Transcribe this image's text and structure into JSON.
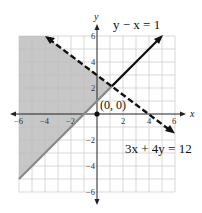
{
  "graph": {
    "x_axis_label": "x",
    "y_axis_label": "y",
    "x_ticks": [
      {
        "value": -6,
        "label": "−6"
      },
      {
        "value": -4,
        "label": "−4"
      },
      {
        "value": -2,
        "label": "−2"
      },
      {
        "value": 2,
        "label": "2"
      },
      {
        "value": 4,
        "label": "4"
      },
      {
        "value": 6,
        "label": "6"
      }
    ],
    "y_ticks": [
      {
        "value": 6,
        "label": "6"
      },
      {
        "value": 4,
        "label": "4"
      },
      {
        "value": 2,
        "label": "2"
      },
      {
        "value": -2,
        "label": "−2"
      },
      {
        "value": -4,
        "label": "−4"
      },
      {
        "value": -6,
        "label": "−6"
      }
    ],
    "range": {
      "xmin": -6,
      "xmax": 6,
      "ymin": -6,
      "ymax": 6
    },
    "lines": [
      {
        "equation": "y − x = 1",
        "style": "solid",
        "color": "#111111"
      },
      {
        "equation": "3x + 4y = 12",
        "style": "dashed",
        "color": "#111111"
      }
    ],
    "test_point": {
      "label": "(0, 0)",
      "x": 0,
      "y": 0
    },
    "shading_color": "#bdbdbd"
  }
}
